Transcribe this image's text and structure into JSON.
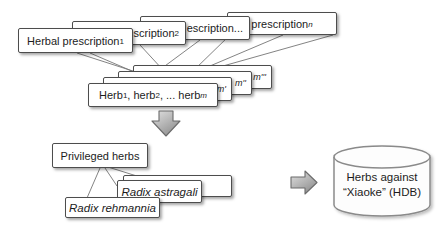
{
  "diagram_title": "herbal-prescription-mining-flow",
  "prescription_stack": {
    "boxes": [
      {
        "label": "Herbal prescription ",
        "sub": "1"
      },
      {
        "label": "scription ",
        "sub": "2"
      },
      {
        "label": "escription...",
        "sub": ""
      },
      {
        "label": "prescription ",
        "sub": "n"
      }
    ]
  },
  "herb_stack": {
    "front_box": {
      "part1": "Herb",
      "sub1": "1",
      "part2": ", herb",
      "sub2": "2",
      "part3": ", ... herb ",
      "sub3": "m"
    },
    "back_labels": [
      "m'",
      "m''",
      "m'''"
    ]
  },
  "privileged_section": {
    "title": "Privileged herbs",
    "herb_examples": [
      "Radix astragali",
      "Radix rehmannia"
    ]
  },
  "database": {
    "label_line1": "Herbs against",
    "label_line2": "“Xiaoke” (HDB)"
  },
  "icons": {
    "down_arrow": "down-block-arrow-icon",
    "right_arrow": "right-block-arrow-icon",
    "database": "database-cylinder-icon"
  },
  "colors": {
    "box_border": "#4d4d4d",
    "box_fill": "#ffffff",
    "connector_line": "#757575",
    "arrow_fill_light": "#dcdcdc",
    "arrow_fill_dark": "#8f8f8f",
    "arrow_border": "#6b6b6b",
    "cylinder_border": "#8a8a8a",
    "cylinder_fill": "#fdfdfd",
    "text": "#1c1c1c"
  }
}
